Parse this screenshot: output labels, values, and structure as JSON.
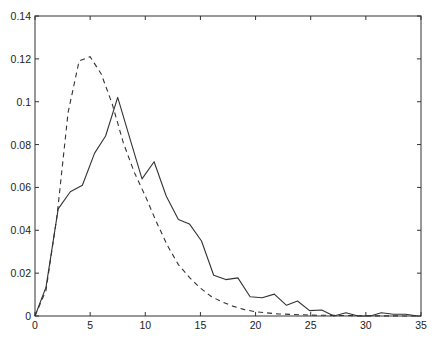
{
  "chart_data": {
    "type": "line",
    "title": "",
    "xlabel": "",
    "ylabel": "",
    "xlim": [
      0,
      35
    ],
    "ylim": [
      0,
      0.14
    ],
    "grid": false,
    "legend": null,
    "x_ticks": [
      0,
      5,
      10,
      15,
      20,
      25,
      30,
      35
    ],
    "x_tick_labels": [
      "0",
      "5",
      "10",
      "15",
      "20",
      "25",
      "30",
      "35"
    ],
    "y_ticks": [
      0,
      0.02,
      0.04,
      0.06,
      0.08,
      0.1,
      0.12,
      0.14
    ],
    "y_tick_labels": [
      "0",
      "0.02",
      "0.04",
      "0.06",
      "0.08",
      "0.1",
      "0.12",
      "0.14"
    ],
    "series": [
      {
        "name": "empirical",
        "style": "solid",
        "color": "#333333",
        "x": [
          0,
          1.0,
          2.1,
          3.2,
          4.3,
          5.4,
          6.4,
          7.5,
          8.6,
          9.7,
          10.8,
          11.9,
          13.0,
          14.0,
          15.1,
          16.2,
          17.3,
          18.4,
          19.5,
          20.6,
          21.7,
          22.8,
          23.8,
          24.9,
          26.0,
          27.1,
          28.2,
          29.3,
          30.4,
          31.4,
          32.5,
          33.6,
          34.7
        ],
        "y": [
          0,
          0.0135,
          0.05,
          0.058,
          0.061,
          0.076,
          0.084,
          0.102,
          0.083,
          0.064,
          0.072,
          0.056,
          0.045,
          0.043,
          0.035,
          0.019,
          0.017,
          0.0178,
          0.009,
          0.0085,
          0.0102,
          0.005,
          0.007,
          0.0025,
          0.0028,
          0.0,
          0.0015,
          0.0,
          0.0,
          0.0015,
          0.0008,
          0.0008,
          0.0
        ]
      },
      {
        "name": "model",
        "style": "dashed",
        "color": "#333333",
        "x": [
          0,
          1,
          2,
          3,
          4,
          5,
          6,
          7,
          8,
          9,
          10,
          11,
          12,
          13,
          14,
          15,
          16,
          17,
          18,
          19,
          20,
          22,
          25,
          30,
          35
        ],
        "y": [
          0,
          0.012,
          0.047,
          0.095,
          0.119,
          0.121,
          0.113,
          0.099,
          0.081,
          0.067,
          0.056,
          0.044,
          0.033,
          0.024,
          0.018,
          0.013,
          0.009,
          0.0065,
          0.0045,
          0.003,
          0.002,
          0.001,
          0.0004,
          0.0001,
          0
        ]
      }
    ]
  }
}
